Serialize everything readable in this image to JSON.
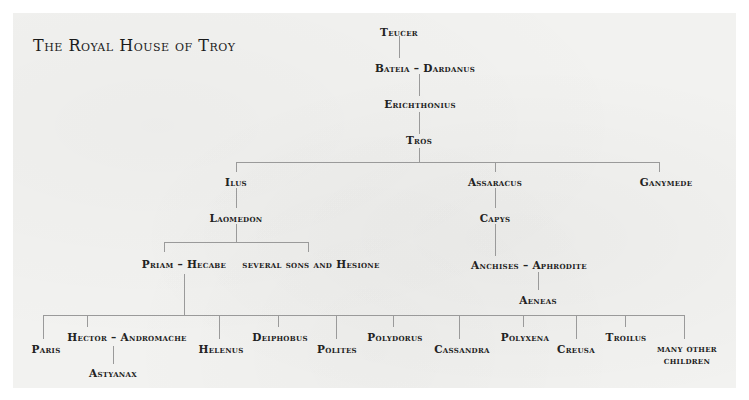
{
  "title": "The Royal House of Troy",
  "nodes": {
    "teucer": "Teucer",
    "bateia_dardanus": "Bateia – Dardanus",
    "erichthonius": "Erichthonius",
    "tros": "Tros",
    "ilus": "Ilus",
    "assaracus": "Assaracus",
    "ganymede": "Ganymede",
    "laomedon": "Laomedon",
    "capys": "Capys",
    "priam_hecabe": "Priam – Hecabe",
    "several_sons": "several sons and Hesione",
    "anchises_aphrodite": "Anchises – Aphrodite",
    "aeneas": "Aeneas",
    "paris": "Paris",
    "hector_andromache": "Hector – Andromache",
    "astyanax": "Astyanax",
    "helenus": "Helenus",
    "deiphobus": "Deiphobus",
    "polites": "Polites",
    "polydorus": "Polydorus",
    "cassandra": "Cassandra",
    "polyxena": "Polyxena",
    "creusa": "Creusa",
    "troilus": "Troilus",
    "many_other_1": "many other",
    "many_other_2": "children"
  },
  "colors": {
    "background": "#f2f2f0",
    "line": "#9a9a9a",
    "text": "#222222"
  }
}
